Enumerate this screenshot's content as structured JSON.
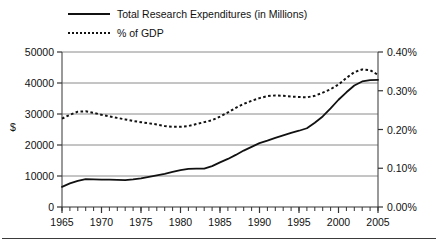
{
  "figure": {
    "axis_label_left": "$",
    "legend": [
      {
        "label": "Total Research Expenditures (in Millions)",
        "style": "solid",
        "icon": "solid-line-icon"
      },
      {
        "label": "% of GDP",
        "style": "dotted",
        "icon": "dotted-line-icon"
      }
    ]
  },
  "chart_data": {
    "type": "line",
    "title": "",
    "xlabel": "",
    "ylabel": "$",
    "y2label": "",
    "grid": true,
    "legend_position": "top-left",
    "x": [
      1965,
      1966,
      1967,
      1968,
      1969,
      1970,
      1971,
      1972,
      1973,
      1974,
      1975,
      1976,
      1977,
      1978,
      1979,
      1980,
      1981,
      1982,
      1983,
      1984,
      1985,
      1986,
      1987,
      1988,
      1989,
      1990,
      1991,
      1992,
      1993,
      1994,
      1995,
      1996,
      1997,
      1998,
      1999,
      2000,
      2001,
      2002,
      2003,
      2004,
      2005
    ],
    "xlim": [
      1965,
      2005
    ],
    "xticks": [
      1965,
      1970,
      1975,
      1980,
      1985,
      1990,
      1995,
      2000,
      2005
    ],
    "xticklabels": [
      "1965",
      "1970",
      "1975",
      "1980",
      "1985",
      "1990",
      "1995",
      "2000",
      "2005"
    ],
    "xminor_tick_interval": 1,
    "ylim": [
      0,
      50000
    ],
    "yticks": [
      0,
      10000,
      20000,
      30000,
      40000,
      50000
    ],
    "yticklabels": [
      "0",
      "10000",
      "20000",
      "30000",
      "40000",
      "50000"
    ],
    "y2lim": [
      0.0,
      0.4
    ],
    "y2ticks": [
      0.0,
      0.1,
      0.2,
      0.3,
      0.4
    ],
    "y2ticklabels": [
      "0.00%",
      "0.10%",
      "0.20%",
      "0.30%",
      "0.40%"
    ],
    "series": [
      {
        "name": "Total Research Expenditures (in Millions)",
        "style": "solid",
        "axis": "left",
        "values": [
          6500,
          7600,
          8400,
          9000,
          8900,
          8800,
          8800,
          8750,
          8700,
          8900,
          9200,
          9700,
          10200,
          10700,
          11300,
          11900,
          12300,
          12400,
          12400,
          13200,
          14400,
          15500,
          16800,
          18200,
          19400,
          20600,
          21400,
          22300,
          23100,
          23900,
          24600,
          25400,
          27200,
          29200,
          31800,
          34600,
          37000,
          39200,
          40500,
          40900,
          41000
        ]
      },
      {
        "name": "% of GDP",
        "style": "dotted",
        "axis": "right",
        "values": [
          0.228,
          0.238,
          0.246,
          0.247,
          0.243,
          0.238,
          0.234,
          0.23,
          0.226,
          0.222,
          0.219,
          0.216,
          0.213,
          0.209,
          0.207,
          0.207,
          0.209,
          0.214,
          0.219,
          0.224,
          0.233,
          0.244,
          0.256,
          0.266,
          0.274,
          0.281,
          0.286,
          0.288,
          0.287,
          0.285,
          0.284,
          0.283,
          0.287,
          0.295,
          0.304,
          0.316,
          0.333,
          0.348,
          0.355,
          0.353,
          0.341
        ]
      }
    ]
  }
}
